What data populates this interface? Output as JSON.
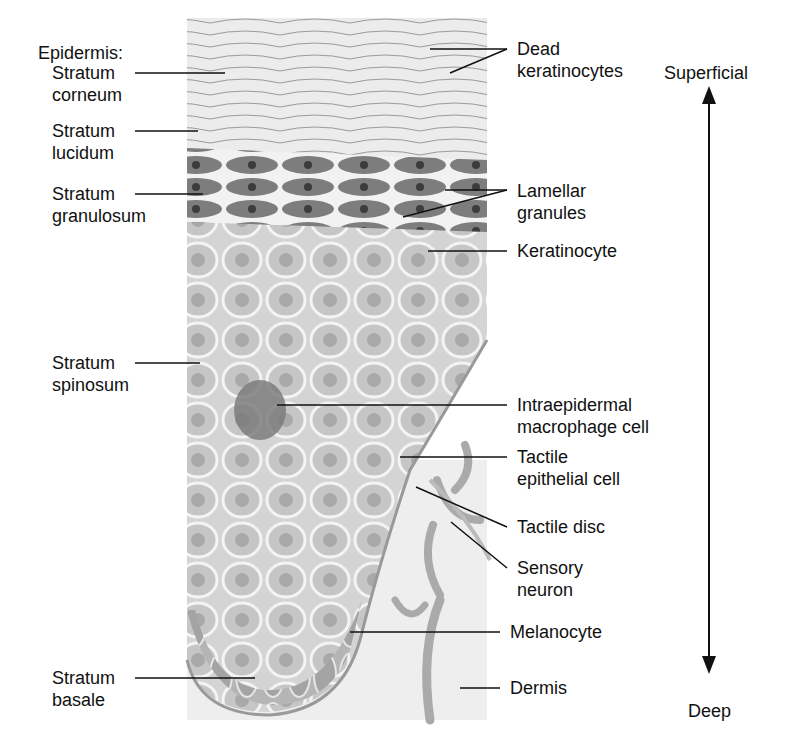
{
  "left_labels": {
    "epidermis_heading": "Epidermis:",
    "corneum": [
      "Stratum",
      "corneum"
    ],
    "lucidum": [
      "Stratum",
      "lucidum"
    ],
    "granulosum": [
      "Stratum",
      "granulosum"
    ],
    "spinosum": [
      "Stratum",
      "spinosum"
    ],
    "basale": [
      "Stratum",
      "basale"
    ]
  },
  "right_labels": {
    "dead_keratinocytes": [
      "Dead",
      "keratinocytes"
    ],
    "lamellar_granules": [
      "Lamellar",
      "granules"
    ],
    "keratinocyte": [
      "Keratinocyte"
    ],
    "macrophage": [
      "Intraepidermal",
      "macrophage cell"
    ],
    "tactile_epithelial": [
      "Tactile",
      "epithelial cell"
    ],
    "tactile_disc": [
      "Tactile disc"
    ],
    "sensory_neuron": [
      "Sensory",
      "neuron"
    ],
    "melanocyte": [
      "Melanocyte"
    ],
    "dermis": [
      "Dermis"
    ]
  },
  "axis": {
    "top": "Superficial",
    "bottom": "Deep"
  },
  "colors": {
    "ink": "#111111",
    "corneum": "#e6e6e6",
    "granulosum": "#7a7a7a",
    "spinosum": "#c9c9c9",
    "basale": "#a8a8a8",
    "dermis": "#eeeeee"
  }
}
